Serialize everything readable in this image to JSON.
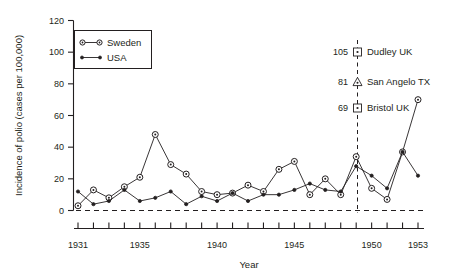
{
  "chart_data": {
    "type": "line",
    "title": "",
    "xlabel": "Year",
    "ylabel": "Incidence of polio (cases per 100,000)",
    "xlim": [
      1931,
      1953
    ],
    "ylim": [
      0,
      120
    ],
    "yticks": [
      0,
      20,
      40,
      60,
      80,
      100,
      120
    ],
    "ytick_labels": [
      "0",
      "20",
      "40",
      "60",
      "80",
      "100",
      "120"
    ],
    "xticks": [
      1931,
      1932,
      1933,
      1934,
      1935,
      1936,
      1937,
      1938,
      1939,
      1940,
      1941,
      1942,
      1943,
      1944,
      1945,
      1946,
      1947,
      1948,
      1949,
      1950,
      1951,
      1952,
      1953
    ],
    "xtick_labels_shown": [
      "1931",
      "1935",
      "1940",
      "1945",
      "1950",
      "1953"
    ],
    "xtick_label_years": [
      1931,
      1935,
      1940,
      1945,
      1950,
      1953
    ],
    "grid": false,
    "legend_position": "top-left",
    "x": [
      1931,
      1932,
      1933,
      1934,
      1935,
      1936,
      1937,
      1938,
      1939,
      1940,
      1941,
      1942,
      1943,
      1944,
      1945,
      1946,
      1947,
      1948,
      1949,
      1950,
      1951,
      1952,
      1953
    ],
    "series": [
      {
        "name": "Sweden",
        "marker": "open-circle-dot",
        "values": [
          3,
          13,
          8,
          15,
          21,
          48,
          29,
          23,
          12,
          10,
          11,
          16,
          12,
          26,
          31,
          10,
          20,
          10,
          34,
          14,
          7,
          37,
          70
        ]
      },
      {
        "name": "USA",
        "marker": "small-dot",
        "values": [
          12,
          4,
          6,
          13,
          6,
          8,
          12,
          4,
          9,
          6,
          11,
          6,
          10,
          10,
          13,
          17,
          13,
          12,
          28,
          22,
          14,
          37,
          22
        ]
      }
    ],
    "annotations": [
      {
        "value": "105",
        "label": "Dudley UK",
        "marker": "square"
      },
      {
        "value": "81",
        "label": "San Angelo TX",
        "marker": "triangle"
      },
      {
        "value": "69",
        "label": "Bristol UK",
        "marker": "square"
      }
    ],
    "reference_line": {
      "year": 1949,
      "style": "dashed-vertical"
    },
    "baseline": {
      "value": 0,
      "style": "dashed-horizontal"
    },
    "colors": {
      "ink": "#231f20",
      "background": "#ffffff"
    }
  }
}
